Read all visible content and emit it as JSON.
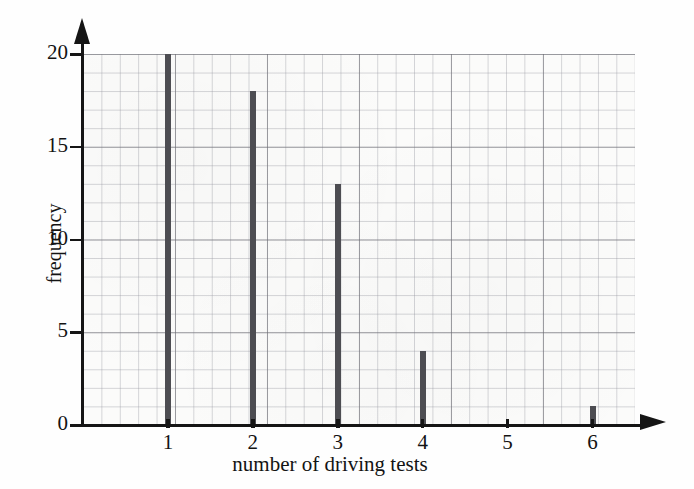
{
  "chart_data": {
    "type": "bar",
    "title": "",
    "subtitle": "",
    "xlabel": "number of driving tests",
    "ylabel": "frequency",
    "categories": [
      "1",
      "2",
      "3",
      "4",
      "5",
      "6"
    ],
    "values": [
      20,
      18,
      13,
      4,
      0,
      1
    ],
    "x": [
      1,
      2,
      3,
      4,
      5,
      6
    ],
    "xlim": [
      0,
      6.5
    ],
    "ylim": [
      0,
      20
    ],
    "y_ticks": [
      "0",
      "5",
      "10",
      "15",
      "20"
    ],
    "y_tick_values": [
      0,
      5,
      10,
      15,
      20
    ],
    "x_ticks": [
      "1",
      "2",
      "3",
      "4",
      "5",
      "6"
    ],
    "grid": true,
    "grid_minor_step": 1,
    "grid_major_step": 5,
    "legend": "none",
    "bar_color": "#4d4d52",
    "grid_color": "#969ba0",
    "axis_color": "#151515",
    "background_color": "#fbfbfa",
    "annotations": []
  }
}
